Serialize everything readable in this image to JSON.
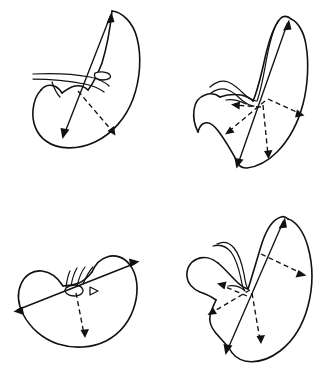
{
  "figure": {
    "background_color": "#ffffff",
    "ink_color": "#111111",
    "columns": 2,
    "rows": 2,
    "has_text_labels": false,
    "panel_count": 4
  },
  "panels": [
    {
      "id": "panel-1",
      "position": "top-left",
      "shape_description": "crescent / comma-shaped organ outline with upper hilar vessel bands and small oval marking",
      "features": {
        "hilum_oval": true,
        "vessel_bands": 2,
        "hatch_marks": 0,
        "notch": true
      },
      "measurements": [
        {
          "name": "long-axis",
          "style": "solid",
          "arrowheads": 2,
          "orientation": "diagonal-upper-right-to-lower-left"
        },
        {
          "name": "short-axis",
          "style": "dashed",
          "arrowheads": 1,
          "orientation": "diagonal-down-right"
        }
      ]
    },
    {
      "id": "panel-2",
      "position": "top-right",
      "shape_description": "narrow elongated tapering outline with lobed lower-left body and pointed superior tip",
      "features": {
        "hilum_oval": false,
        "vessel_bands": 2,
        "hatch_marks": 0,
        "notch": true
      },
      "measurements": [
        {
          "name": "long-axis",
          "style": "solid",
          "arrowheads": 2,
          "orientation": "diagonal-upper-right-to-lower-left"
        },
        {
          "name": "radial-axis-1",
          "style": "dashed",
          "arrowheads": 1,
          "orientation": "down-left"
        },
        {
          "name": "radial-axis-2",
          "style": "dashed",
          "arrowheads": 1,
          "orientation": "up-left"
        },
        {
          "name": "radial-axis-3",
          "style": "dashed",
          "arrowheads": 1,
          "orientation": "down"
        },
        {
          "name": "radial-axis-4",
          "style": "dashed",
          "arrowheads": 1,
          "orientation": "right"
        }
      ]
    },
    {
      "id": "panel-3",
      "position": "bottom-left",
      "shape_description": "wide bilobed kidney-bean outline with central notch and small oval at the hilum",
      "features": {
        "hilum_oval": true,
        "vessel_bands": 0,
        "hatch_marks": 4,
        "notch": true
      },
      "measurements": [
        {
          "name": "long-axis",
          "style": "solid",
          "arrowheads": 2,
          "orientation": "horizontal-diagonal"
        },
        {
          "name": "short-axis",
          "style": "dashed",
          "arrowheads": 1,
          "orientation": "vertical-down"
        }
      ]
    },
    {
      "id": "panel-4",
      "position": "bottom-right",
      "shape_description": "large tilted outline with rounded lower-left lobe, deep central notch with hooked vessel, and pointed superior apex",
      "features": {
        "hilum_oval": false,
        "vessel_bands": 2,
        "hatch_marks": 0,
        "notch": true
      },
      "measurements": [
        {
          "name": "long-axis",
          "style": "solid",
          "arrowheads": 2,
          "orientation": "diagonal-upper-right-to-lower-left"
        },
        {
          "name": "radial-axis-1",
          "style": "dashed",
          "arrowheads": 1,
          "orientation": "down-left"
        },
        {
          "name": "radial-axis-2",
          "style": "dashed",
          "arrowheads": 1,
          "orientation": "up-left"
        },
        {
          "name": "radial-axis-3",
          "style": "dashed",
          "arrowheads": 1,
          "orientation": "down"
        },
        {
          "name": "radial-axis-4",
          "style": "dashed",
          "arrowheads": 1,
          "orientation": "right"
        }
      ]
    }
  ]
}
